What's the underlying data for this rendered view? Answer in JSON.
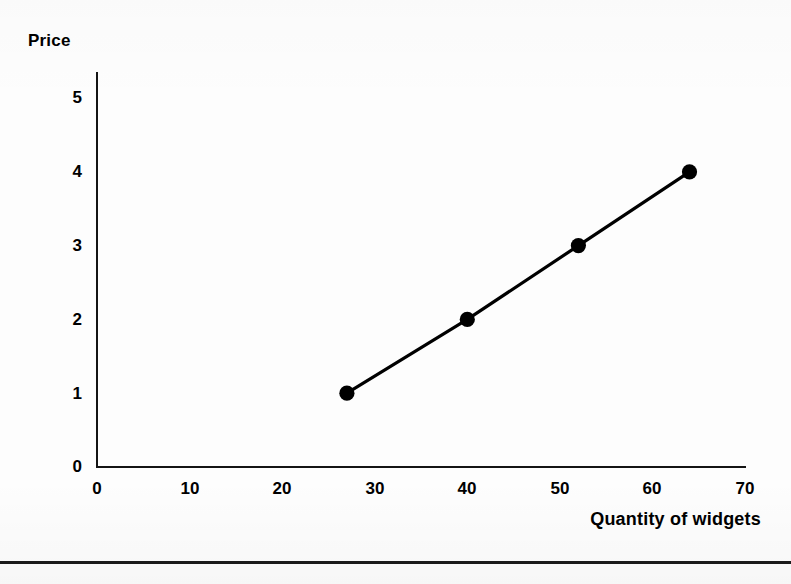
{
  "figure": {
    "background_color": "#fdfdfd",
    "ink_color": "#000000",
    "bottom_rule_color": "#1a1a1a"
  },
  "chart_data": {
    "type": "line",
    "title": "",
    "subtitle": "",
    "xlabel": "Quantity of widgets",
    "ylabel": "Price",
    "x": [
      27,
      40,
      52,
      64
    ],
    "values": [
      1,
      2,
      3,
      4
    ],
    "series": [
      {
        "name": "Supply",
        "x": [
          27,
          40,
          52,
          64
        ],
        "values": [
          1,
          2,
          3,
          4
        ]
      }
    ],
    "points": [
      {
        "x": 27,
        "y": 1
      },
      {
        "x": 40,
        "y": 2
      },
      {
        "x": 52,
        "y": 3
      },
      {
        "x": 64,
        "y": 4
      }
    ],
    "xlim": [
      0,
      70
    ],
    "ylim": [
      0,
      5
    ],
    "xticks": [
      0,
      10,
      20,
      30,
      40,
      50,
      60,
      70
    ],
    "yticks": [
      0,
      1,
      2,
      3,
      4,
      5
    ],
    "xtick_labels": [
      "0",
      "10",
      "20",
      "30",
      "40",
      "50",
      "60",
      "70"
    ],
    "ytick_labels": [
      "0",
      "1",
      "2",
      "3",
      "4",
      "5"
    ],
    "grid": false,
    "legend": null,
    "marker": "filled-circle",
    "line_color": "#000000",
    "marker_color": "#000000",
    "annotations": []
  },
  "axis_titles": {
    "y": "Price",
    "x": "Quantity of widgets"
  }
}
